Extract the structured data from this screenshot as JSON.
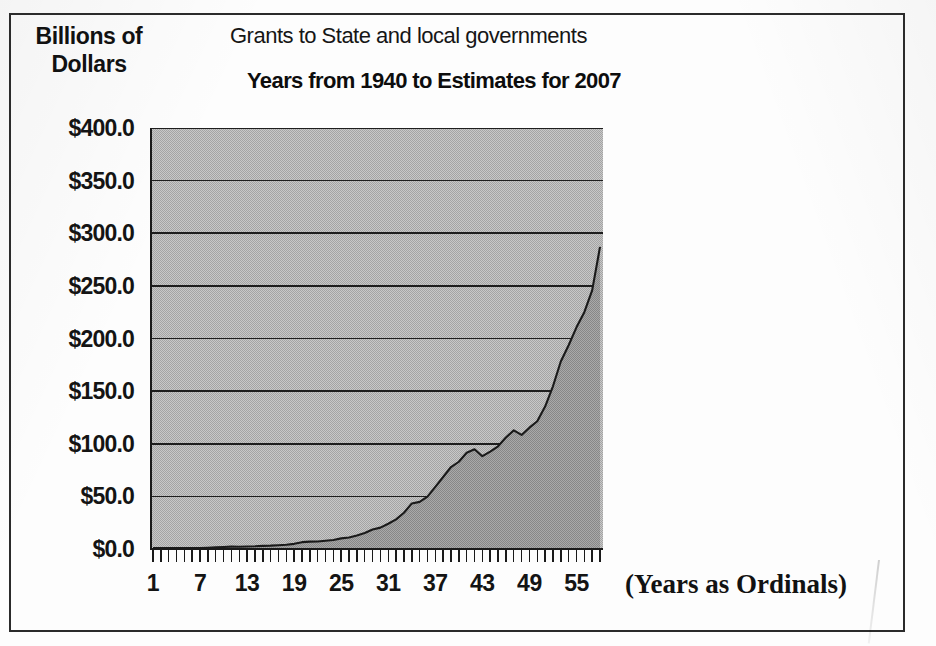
{
  "figure": {
    "y_axis_title": "Billions of Dollars",
    "title": "Grants to State and local governments",
    "subtitle": "Years from 1940 to Estimates for 2007",
    "x_axis_title": "(Years as Ordinals)",
    "colors": {
      "frame": "#2b2b2b",
      "plot_background_above_curve": "#b6b6b6",
      "area_fill_under_curve": "#9a9a9a",
      "gridline": "#1e1e1e",
      "curve_line": "#1a1a1a",
      "axis": "#1a1a1a",
      "text": "#121212",
      "page_background": "#fdfdfd"
    }
  },
  "chart_data": {
    "type": "area",
    "title": "Grants to State and local governments",
    "subtitle": "Years from 1940 to Estimates for 2007",
    "xlabel": "(Years as Ordinals)",
    "ylabel": "Billions of Dollars",
    "ylim": [
      0,
      400
    ],
    "xlim": [
      1,
      58
    ],
    "grid": true,
    "legend": "none",
    "y_ticks": [
      0,
      50,
      100,
      150,
      200,
      250,
      300,
      350,
      400
    ],
    "y_tick_labels": [
      "$0.0",
      "$50.0",
      "$100.0",
      "$150.0",
      "$200.0",
      "$250.0",
      "$300.0",
      "$350.0",
      "$400.0"
    ],
    "x_ticks": [
      1,
      7,
      13,
      19,
      25,
      31,
      37,
      43,
      49,
      55
    ],
    "x_tick_labels": [
      "1",
      "7",
      "13",
      "19",
      "25",
      "31",
      "37",
      "43",
      "49",
      "55"
    ],
    "x_minor_tick_every": 1,
    "x_minor_tick_count": 58,
    "series": [
      {
        "name": "Grants to State and local governments",
        "units": "Billions of Dollars",
        "x": [
          1,
          2,
          3,
          4,
          5,
          6,
          7,
          8,
          9,
          10,
          11,
          12,
          13,
          14,
          15,
          16,
          17,
          18,
          19,
          20,
          21,
          22,
          23,
          24,
          25,
          26,
          27,
          28,
          29,
          30,
          31,
          32,
          33,
          34,
          35,
          36,
          37,
          38,
          39,
          40,
          41,
          42,
          43,
          44,
          45,
          46,
          47,
          48,
          49,
          50,
          51,
          52,
          53,
          54,
          55,
          56,
          57,
          58
        ],
        "values": [
          0.9,
          1.0,
          1.0,
          1.0,
          0.9,
          0.9,
          0.8,
          1.2,
          1.6,
          1.9,
          2.3,
          2.2,
          2.4,
          2.6,
          3.0,
          3.2,
          3.6,
          4.0,
          4.9,
          6.5,
          7.0,
          7.1,
          7.9,
          8.6,
          10.1,
          10.9,
          12.9,
          15.2,
          18.6,
          20.3,
          24.0,
          28.1,
          34.4,
          43.3,
          44.8,
          49.8,
          59.1,
          68.4,
          77.9,
          82.9,
          91.5,
          94.8,
          88.2,
          92.5,
          97.6,
          105.9,
          112.7,
          108.4,
          115.3,
          121.4,
          135.3,
          154.6,
          178.1,
          193.6,
          210.6,
          225.0,
          245.7,
          287.0
        ],
        "final_value_label": "approx. $337 billion (2007 estimate)",
        "peak_value": 337.0,
        "notes": "Curve is near zero for ordinals 1-18, rises gradually through the 1960s-70s, dips slightly around ordinals 43 and 48, then climbs steeply after ordinal 50 to about $337 billion at ordinal 58."
      }
    ],
    "curve_points_normalized": [
      [
        1,
        0.9
      ],
      [
        2,
        1.0
      ],
      [
        3,
        1.0
      ],
      [
        4,
        1.0
      ],
      [
        5,
        0.9
      ],
      [
        6,
        0.9
      ],
      [
        7,
        0.8
      ],
      [
        8,
        1.2
      ],
      [
        9,
        1.6
      ],
      [
        10,
        1.9
      ],
      [
        11,
        2.3
      ],
      [
        12,
        2.2
      ],
      [
        13,
        2.4
      ],
      [
        14,
        2.6
      ],
      [
        15,
        3.0
      ],
      [
        16,
        3.2
      ],
      [
        17,
        3.6
      ],
      [
        18,
        4.0
      ],
      [
        19,
        4.9
      ],
      [
        20,
        6.5
      ],
      [
        21,
        7.0
      ],
      [
        22,
        7.1
      ],
      [
        23,
        7.9
      ],
      [
        24,
        8.6
      ],
      [
        25,
        10.1
      ],
      [
        26,
        10.9
      ],
      [
        27,
        12.9
      ],
      [
        28,
        15.2
      ],
      [
        29,
        18.6
      ],
      [
        30,
        20.3
      ],
      [
        31,
        24.0
      ],
      [
        32,
        28.1
      ],
      [
        33,
        34.4
      ],
      [
        34,
        43.3
      ],
      [
        35,
        44.8
      ],
      [
        36,
        49.8
      ],
      [
        37,
        59.1
      ],
      [
        38,
        68.4
      ],
      [
        39,
        77.9
      ],
      [
        40,
        82.9
      ],
      [
        41,
        91.5
      ],
      [
        42,
        94.8
      ],
      [
        43,
        88.2
      ],
      [
        44,
        92.5
      ],
      [
        45,
        97.6
      ],
      [
        46,
        105.9
      ],
      [
        47,
        112.7
      ],
      [
        48,
        108.4
      ],
      [
        49,
        115.3
      ],
      [
        50,
        121.4
      ],
      [
        51,
        135.3
      ],
      [
        52,
        154.6
      ],
      [
        53,
        178.1
      ],
      [
        54,
        193.6
      ],
      [
        55,
        210.6
      ],
      [
        56,
        225.0
      ],
      [
        57,
        245.7
      ],
      [
        58,
        337.0
      ]
    ]
  }
}
